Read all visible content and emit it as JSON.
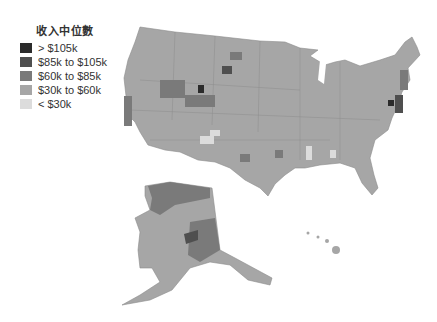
{
  "legend": {
    "title": "收入中位數",
    "items": [
      {
        "label": "> $105k",
        "color": "#2b2b2b"
      },
      {
        "label": "$85k to $105k",
        "color": "#4f4f4f"
      },
      {
        "label": "$60k to $85k",
        "color": "#7a7a7a"
      },
      {
        "label": "$30k to $60k",
        "color": "#a6a6a6"
      },
      {
        "label": "< $30k",
        "color": "#dcdcdc"
      }
    ]
  },
  "map": {
    "regions": [
      "contiguous-us",
      "alaska",
      "hawaii"
    ]
  }
}
